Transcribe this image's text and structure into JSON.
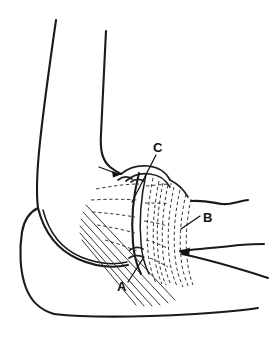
{
  "figure": {
    "background_color": "#ffffff",
    "line_color": "#1a1a1a",
    "label_color": "#111111"
  },
  "labels": [
    {
      "id": "label-a",
      "text": "A",
      "x": 122,
      "y": 290,
      "leader_from": [
        129,
        283
      ],
      "leader_to": [
        143,
        258
      ],
      "description": "Lower suture anchor point on the ulna"
    },
    {
      "id": "label-b",
      "text": "B",
      "x": 206,
      "y": 222,
      "leader_from": [
        201,
        216
      ],
      "leader_to": [
        182,
        228
      ],
      "description": "Striated extensor / ligament fiber band on the radial side"
    },
    {
      "id": "label-c",
      "text": "C",
      "x": 157,
      "y": 151,
      "leader_from": [
        156,
        155
      ],
      "leader_to": [
        133,
        200
      ],
      "description": "Proximal suture passing through the lateral epicondyle region"
    }
  ],
  "arrows": [
    {
      "id": "arrow-epicondyle",
      "tip": [
        120,
        174
      ],
      "tail": [
        100,
        167
      ],
      "description": "Arrow pointing to the lateral epicondyle attachment site"
    },
    {
      "id": "arrow-radial-neck",
      "tip": [
        180,
        252
      ],
      "tail": [
        262,
        245
      ],
      "description": "Arrow along the radial neck from the right"
    }
  ],
  "structures": [
    {
      "id": "humerus-anterior",
      "name": "humerus-anterior-cortex"
    },
    {
      "id": "humerus-posterior",
      "name": "humerus-posterior-cortex"
    },
    {
      "id": "olecranon",
      "name": "olecranon-and-ulna"
    },
    {
      "id": "trochlea-notch",
      "name": "trochlear-notch"
    },
    {
      "id": "radial-head",
      "name": "radial-head"
    },
    {
      "id": "forearm-dorsal",
      "name": "forearm-dorsal-contour"
    },
    {
      "id": "forearm-volar",
      "name": "forearm-volar-contour"
    },
    {
      "id": "fiber-band",
      "name": "ligament-fiber-band"
    },
    {
      "id": "suture-fan",
      "name": "suture-fan"
    }
  ],
  "counts": {
    "suture_fan_lines": 6,
    "dashed_fiber_lines_right": 8,
    "dashed_fiber_lines_left": 5,
    "label_count": 3
  }
}
